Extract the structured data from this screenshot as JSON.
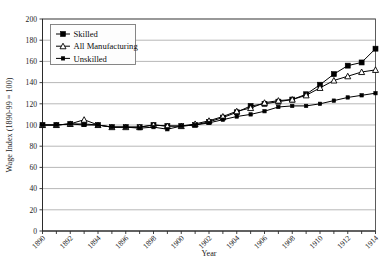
{
  "chart_data": {
    "type": "line",
    "title": "",
    "xlabel": "Year",
    "ylabel": "Wage Index (1890-99 = 100)",
    "xlim": [
      1890,
      1914
    ],
    "ylim": [
      0,
      200
    ],
    "ytick_step": 20,
    "xtick_step": 1,
    "xtick_label_step": 2,
    "grid": true,
    "legend_position": "upper-left",
    "yticks": [
      0,
      20,
      40,
      60,
      80,
      100,
      120,
      140,
      160,
      180,
      200
    ],
    "xticks": [
      1890,
      1891,
      1892,
      1893,
      1894,
      1895,
      1896,
      1897,
      1898,
      1899,
      1900,
      1901,
      1902,
      1903,
      1904,
      1905,
      1906,
      1907,
      1908,
      1909,
      1910,
      1911,
      1912,
      1913,
      1914
    ],
    "xtick_labels": [
      "1890",
      "",
      "1892",
      "",
      "1894",
      "",
      "1896",
      "",
      "1898",
      "",
      "1900",
      "",
      "1902",
      "",
      "1904",
      "",
      "1906",
      "",
      "1908",
      "",
      "1910",
      "",
      "1912",
      "",
      "1914"
    ],
    "x": [
      1890,
      1891,
      1892,
      1893,
      1894,
      1895,
      1896,
      1897,
      1898,
      1899,
      1900,
      1901,
      1902,
      1903,
      1904,
      1905,
      1906,
      1907,
      1908,
      1909,
      1910,
      1911,
      1912,
      1913,
      1914
    ],
    "series": [
      {
        "name": "Skilled",
        "marker": "square-filled",
        "values": [
          100,
          100,
          101,
          101,
          100,
          98,
          98,
          98,
          100,
          99,
          99,
          100,
          103,
          107,
          112,
          118,
          120,
          122,
          124,
          129,
          138,
          148,
          156,
          159,
          172
        ]
      },
      {
        "name": "All Manufacturing",
        "marker": "triangle-open",
        "values": [
          100,
          100,
          101,
          105,
          100,
          98,
          98,
          98,
          100,
          99,
          99,
          101,
          104,
          108,
          113,
          116,
          121,
          123,
          124,
          128,
          135,
          142,
          146,
          150,
          152
        ]
      },
      {
        "name": "Unskilled",
        "marker": "square-small",
        "values": [
          100,
          100,
          101,
          100,
          100,
          98,
          98,
          97,
          98,
          96,
          99,
          100,
          102,
          105,
          108,
          110,
          113,
          117,
          118,
          118,
          120,
          123,
          126,
          128,
          130
        ]
      }
    ]
  },
  "legend": {
    "entries": [
      {
        "label": "Skilled"
      },
      {
        "label": "All Manufacturing"
      },
      {
        "label": "Unskilled"
      }
    ]
  },
  "colors": {
    "series": "#000000",
    "grid": "#9a9a9a",
    "axis": "#2b2b2b",
    "background": "#ffffff"
  }
}
